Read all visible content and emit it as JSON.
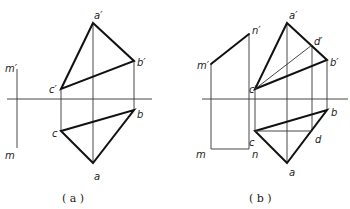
{
  "figure_a": {
    "caption": "( a )",
    "labels": {
      "m_prime": "m′",
      "a_prime": "a′",
      "b_prime": "b′",
      "c_prime": "c′",
      "m": "m",
      "a": "a",
      "b": "b",
      "c": "c"
    }
  },
  "figure_b": {
    "caption": "( b )",
    "labels": {
      "m_prime": "m′",
      "n_prime": "n′",
      "a_prime": "a′",
      "b_prime": "b′",
      "c_prime": "c′",
      "d_prime": "d′",
      "m": "m",
      "n": "n",
      "a": "a",
      "b": "b",
      "c": "c",
      "d": "d"
    }
  }
}
